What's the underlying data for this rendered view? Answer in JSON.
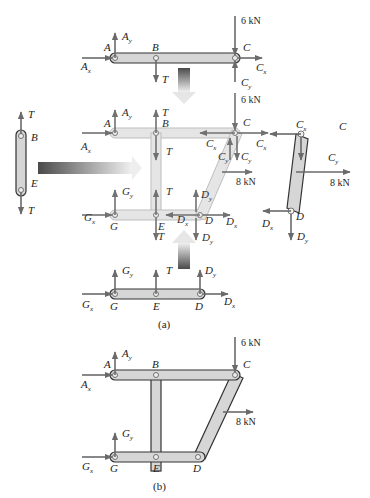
{
  "figure": {
    "caption_a": "(a)",
    "caption_b": "(b)"
  },
  "labels": {
    "A": "A",
    "B": "B",
    "C": "C",
    "D": "D",
    "E": "E",
    "G": "G",
    "Ax": "A",
    "Ay": "A",
    "Cx": "C",
    "Cy": "C",
    "Dx": "D",
    "Dy": "D",
    "Gx": "G",
    "Gy": "G",
    "T": "T",
    "x": "x",
    "y": "y"
  },
  "loads": {
    "vertical": "6 kN",
    "horizontal": "8 kN"
  },
  "colors": {
    "member_fill": "#d6d6d6",
    "member_stroke": "#333333",
    "arrow": "#6a6a6a",
    "transfer_arrow_dark": "#555555",
    "transfer_arrow_light": "#e8e8e8"
  }
}
